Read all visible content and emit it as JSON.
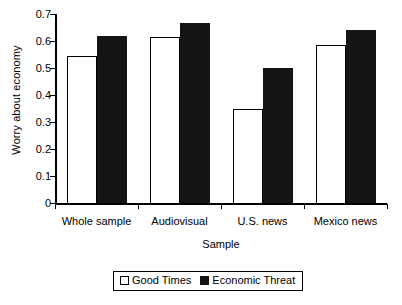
{
  "chart_data": {
    "type": "bar",
    "title": "",
    "xlabel": "Sample",
    "ylabel": "Worry about economy",
    "categories": [
      "Whole sample",
      "Audiovisual",
      "U.S. news",
      "Mexico news"
    ],
    "series": [
      {
        "name": "Good Times",
        "values": [
          0.545,
          0.615,
          0.348,
          0.585
        ],
        "style": "open"
      },
      {
        "name": "Economic Threat",
        "values": [
          0.62,
          0.665,
          0.5,
          0.64
        ],
        "style": "filled"
      }
    ],
    "ylim": [
      0,
      0.7
    ],
    "ytick_labels": [
      "0",
      "0.1",
      "0.2",
      "0.3",
      "0.4",
      "0.5",
      "0.6",
      "0.7"
    ],
    "ytick_values": [
      0,
      0.1,
      0.2,
      0.3,
      0.4,
      0.5,
      0.6,
      0.7
    ],
    "grid": false,
    "legend_position": "bottom-center",
    "colors": {
      "open": "#ffffff",
      "filled": "#151515",
      "axis": "#000000"
    }
  }
}
